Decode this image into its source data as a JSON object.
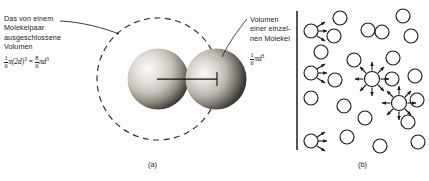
{
  "figure": {
    "panel_a": {
      "caption": "(a)",
      "annotation_left": {
        "lines": [
          "Das von einem",
          "Molekelpaar",
          "ausgeschlossene",
          "Volumen"
        ],
        "formula": {
          "frac1_num": "1",
          "frac1_den": "6",
          "term1": "π(2d)",
          "term1_exp": "3",
          "equals": "=",
          "frac2_num": "8",
          "frac2_den": "6",
          "term2": "πd",
          "term2_exp": "3"
        }
      },
      "annotation_right": {
        "lines": [
          "Volumen",
          "einer einzel-",
          "nen Molekel"
        ],
        "formula": {
          "frac_num": "1",
          "frac_den": "6",
          "term": "πd",
          "term_exp": "3"
        }
      },
      "spheres": [
        {
          "name": "left-molecule-sphere",
          "cx": 158,
          "cy": 79,
          "r": 30
        },
        {
          "name": "right-molecule-sphere",
          "cx": 216,
          "cy": 79,
          "r": 30
        }
      ],
      "excluded_volume_circle": {
        "cx": 158,
        "cy": 79,
        "r": 61,
        "style": "dashed"
      },
      "diameter_line": {
        "x1": 158,
        "y1": 79,
        "x2": 217,
        "y2": 79,
        "label": "2d"
      },
      "leader_left": {
        "from_x": 60,
        "from_y": 22,
        "to_x": 118,
        "to_y": 33
      },
      "leader_right": {
        "from_x": 247,
        "from_y": 18,
        "to_x": 222,
        "to_y": 56
      }
    },
    "panel_b": {
      "caption": "(b)",
      "wall": {
        "x": 297,
        "y1": 11,
        "y2": 150
      },
      "molecules": [
        {
          "cx": 311,
          "cy": 31,
          "r": 7,
          "arrows": "wall"
        },
        {
          "cx": 340,
          "cy": 18,
          "r": 7,
          "arrows": "none"
        },
        {
          "cx": 334,
          "cy": 36,
          "r": 7,
          "arrows": "none"
        },
        {
          "cx": 321,
          "cy": 52,
          "r": 7,
          "arrows": "none"
        },
        {
          "cx": 368,
          "cy": 30,
          "r": 7,
          "arrows": "none"
        },
        {
          "cx": 382,
          "cy": 32,
          "r": 7,
          "arrows": "none"
        },
        {
          "cx": 403,
          "cy": 16,
          "r": 7,
          "arrows": "none"
        },
        {
          "cx": 411,
          "cy": 36,
          "r": 7,
          "arrows": "none"
        },
        {
          "cx": 311,
          "cy": 73,
          "r": 7,
          "arrows": "wall"
        },
        {
          "cx": 335,
          "cy": 80,
          "r": 7,
          "arrows": "none"
        },
        {
          "cx": 354,
          "cy": 60,
          "r": 7,
          "arrows": "none"
        },
        {
          "cx": 372,
          "cy": 79,
          "r": 8,
          "arrows": "all"
        },
        {
          "cx": 393,
          "cy": 58,
          "r": 7,
          "arrows": "none"
        },
        {
          "cx": 392,
          "cy": 79,
          "r": 7,
          "arrows": "none"
        },
        {
          "cx": 415,
          "cy": 76,
          "r": 7,
          "arrows": "none"
        },
        {
          "cx": 311,
          "cy": 98,
          "r": 7,
          "arrows": "none"
        },
        {
          "cx": 344,
          "cy": 106,
          "r": 7,
          "arrows": "none"
        },
        {
          "cx": 399,
          "cy": 103,
          "r": 8,
          "arrows": "all"
        },
        {
          "cx": 417,
          "cy": 100,
          "r": 7,
          "arrows": "none"
        },
        {
          "cx": 365,
          "cy": 118,
          "r": 7,
          "arrows": "none"
        },
        {
          "cx": 408,
          "cy": 122,
          "r": 7,
          "arrows": "none"
        },
        {
          "cx": 347,
          "cy": 137,
          "r": 7,
          "arrows": "none"
        },
        {
          "cx": 311,
          "cy": 141,
          "r": 7,
          "arrows": "wall"
        },
        {
          "cx": 380,
          "cy": 146,
          "r": 7,
          "arrows": "none"
        },
        {
          "cx": 418,
          "cy": 142,
          "r": 7,
          "arrows": "none"
        }
      ]
    }
  },
  "colors": {
    "ink": "#1c1c1c",
    "background": "#fdfdfd",
    "sphere_shadow": "#2b2b2b",
    "sphere_light": "#f2f0ec"
  }
}
